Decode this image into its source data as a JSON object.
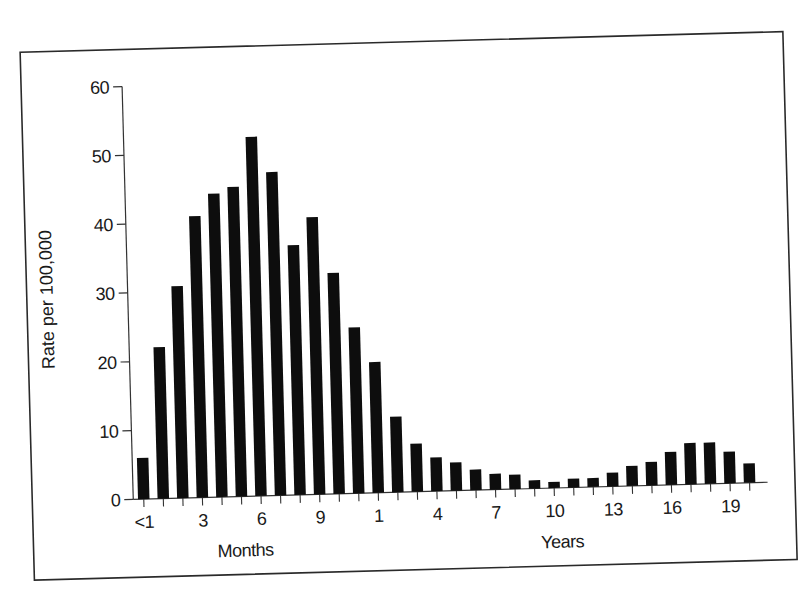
{
  "chart_data": {
    "type": "bar",
    "title": "",
    "xlabel_months": "Months",
    "xlabel_years": "Years",
    "ylabel": "Rate per 100,000",
    "ylim": [
      0,
      60
    ],
    "yticks": [
      0,
      10,
      20,
      30,
      40,
      50,
      60
    ],
    "grid": false,
    "legend": null,
    "categories": [
      "<1 mo",
      "1 mo",
      "2 mo",
      "3 mo",
      "4 mo",
      "5 mo",
      "6 mo",
      "7 mo",
      "8 mo",
      "9 mo",
      "10 mo",
      "11 mo",
      "1 yr",
      "2 yr",
      "3 yr",
      "4 yr",
      "5 yr",
      "6 yr",
      "7 yr",
      "8 yr",
      "9 yr",
      "10 yr",
      "11 yr",
      "12 yr",
      "13 yr",
      "14 yr",
      "15 yr",
      "16 yr",
      "17 yr",
      "18 yr",
      "19 yr",
      "20 yr"
    ],
    "values": [
      6.0,
      22.0,
      30.8,
      40.9,
      44.1,
      45.0,
      52.2,
      47.0,
      36.3,
      40.3,
      32.1,
      24.1,
      19.0,
      11.0,
      7.0,
      4.9,
      4.1,
      3.0,
      2.3,
      2.1,
      1.2,
      0.9,
      1.3,
      1.3,
      2.0,
      2.9,
      3.4,
      4.8,
      6.0,
      6.0,
      4.6,
      2.8
    ],
    "xtick_labels": [
      {
        "index": 0,
        "label": "<1"
      },
      {
        "index": 3,
        "label": "3"
      },
      {
        "index": 6,
        "label": "6"
      },
      {
        "index": 9,
        "label": "9"
      },
      {
        "index": 12,
        "label": "1"
      },
      {
        "index": 15,
        "label": "4"
      },
      {
        "index": 18,
        "label": "7"
      },
      {
        "index": 21,
        "label": "10"
      },
      {
        "index": 24,
        "label": "13"
      },
      {
        "index": 27,
        "label": "16"
      },
      {
        "index": 30,
        "label": "19"
      }
    ],
    "bar_color": "#0d0d0d"
  }
}
